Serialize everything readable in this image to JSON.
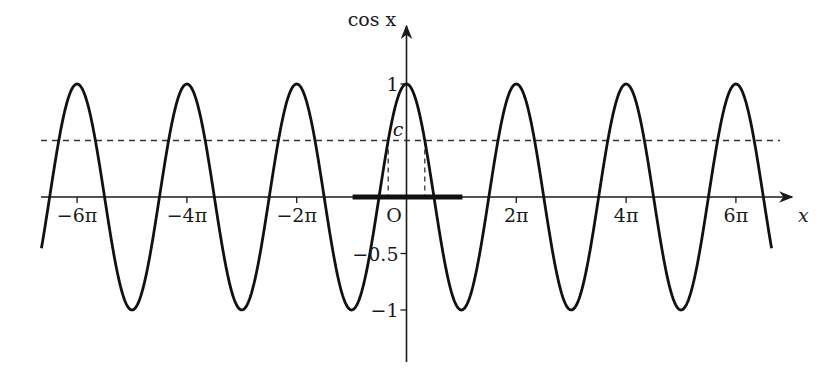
{
  "chart_data": {
    "type": "line",
    "title": "",
    "function": "cos x",
    "xlabel": "x",
    "ylabel": "cos x",
    "xlim_pi": [
      -6.65,
      6.65
    ],
    "ylim": [
      -1,
      1
    ],
    "x_ticks": [
      {
        "value_pi": -6,
        "label": "−6π"
      },
      {
        "value_pi": -4,
        "label": "−4π"
      },
      {
        "value_pi": -2,
        "label": "−2π"
      },
      {
        "value_pi": 2,
        "label": "2π"
      },
      {
        "value_pi": 4,
        "label": "4π"
      },
      {
        "value_pi": 6,
        "label": "6π"
      }
    ],
    "y_ticks": [
      {
        "value": 1,
        "label": "1"
      },
      {
        "value": -0.5,
        "label": "−0.5"
      },
      {
        "value": -1,
        "label": "−1"
      }
    ],
    "origin_label": "O",
    "c_line": {
      "value": 0.5,
      "label": "c"
    },
    "highlighted_interval_pi": [
      -1,
      1
    ],
    "grid": false
  }
}
